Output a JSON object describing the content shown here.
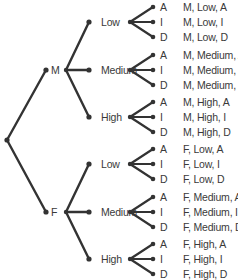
{
  "diagram": {
    "type": "tree",
    "root": "",
    "colors": {
      "line": "#333333",
      "text": "#3a3a3a",
      "background": "#ffffff"
    },
    "level1": [
      {
        "label": "M",
        "children": [
          {
            "label": "Low",
            "children": [
              {
                "label": "A",
                "outcome": "M, Low, A"
              },
              {
                "label": "I",
                "outcome": "M, Low, I"
              },
              {
                "label": "D",
                "outcome": "M, Low, D"
              }
            ]
          },
          {
            "label": "Medium",
            "children": [
              {
                "label": "A",
                "outcome": "M, Medium, A"
              },
              {
                "label": "I",
                "outcome": "M, Medium, I"
              },
              {
                "label": "D",
                "outcome": "M, Medium, D"
              }
            ]
          },
          {
            "label": "High",
            "children": [
              {
                "label": "A",
                "outcome": "M, High, A"
              },
              {
                "label": "I",
                "outcome": "M, High, I"
              },
              {
                "label": "D",
                "outcome": "M, High, D"
              }
            ]
          }
        ]
      },
      {
        "label": "F",
        "children": [
          {
            "label": "Low",
            "children": [
              {
                "label": "A",
                "outcome": "F, Low, A"
              },
              {
                "label": "I",
                "outcome": "F, Low, I"
              },
              {
                "label": "D",
                "outcome": "F, Low, D"
              }
            ]
          },
          {
            "label": "Medium",
            "children": [
              {
                "label": "A",
                "outcome": "F, Medium, A"
              },
              {
                "label": "I",
                "outcome": "F, Medium, I"
              },
              {
                "label": "D",
                "outcome": "F, Medium, D"
              }
            ]
          },
          {
            "label": "High",
            "children": [
              {
                "label": "A",
                "outcome": "F, High, A"
              },
              {
                "label": "I",
                "outcome": "F, High, I"
              },
              {
                "label": "D",
                "outcome": "F, High, D"
              }
            ]
          }
        ]
      }
    ]
  }
}
